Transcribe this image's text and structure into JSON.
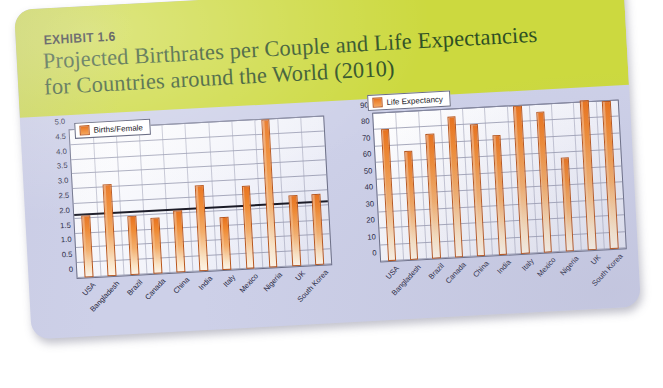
{
  "figure": {
    "exhibit_tag": "EXHIBIT 1.6",
    "title_line1": "Projected Birthrates per Couple and Life Expectancies",
    "title_line2": "for Countries around the World (2010)",
    "header_color": "#ccd93f",
    "title_color": "#2f5024",
    "panel_background": "#cdd0e8",
    "bar_color": "#e8731f"
  },
  "chart_data": [
    {
      "type": "bar",
      "title": "Projected Birthrates per Couple",
      "legend": [
        "Births/Female"
      ],
      "legend_position": "top-left-inside",
      "grid": true,
      "xlabel": "",
      "ylabel": "",
      "ylim": [
        0,
        5.0
      ],
      "yticks": [
        "0",
        "0.5",
        "1.0",
        "1.5",
        "2.0",
        "2.5",
        "3.0",
        "3.5",
        "4.0",
        "4.5",
        "5.0"
      ],
      "ytick_values": [
        0,
        0.5,
        1.0,
        1.5,
        2.0,
        2.5,
        3.0,
        3.5,
        4.0,
        4.5,
        5.0
      ],
      "reference_line": 2.1,
      "categories": [
        "USA",
        "Bangladesh",
        "Brazil",
        "Canada",
        "China",
        "India",
        "Italy",
        "Mexico",
        "Nigeria",
        "UK",
        "South Korea"
      ],
      "values": [
        2.1,
        3.1,
        2.0,
        1.9,
        2.1,
        2.9,
        1.8,
        2.8,
        5.0,
        2.4,
        2.4
      ]
    },
    {
      "type": "bar",
      "title": "Life Expectancies",
      "legend": [
        "Life Expectancy"
      ],
      "legend_position": "top-left-inside",
      "grid": true,
      "xlabel": "",
      "ylabel": "",
      "ylim": [
        0,
        90
      ],
      "yticks": [
        "0",
        "10",
        "20",
        "30",
        "40",
        "50",
        "60",
        "70",
        "80",
        "90"
      ],
      "ytick_values": [
        0,
        10,
        20,
        30,
        40,
        50,
        60,
        70,
        80,
        90
      ],
      "categories": [
        "USA",
        "Bangladesh",
        "Brazil",
        "Canada",
        "China",
        "India",
        "Italy",
        "Mexico",
        "Nigeria",
        "UK",
        "South Korea"
      ],
      "values": [
        80,
        66,
        76,
        86,
        80,
        73,
        90,
        86,
        57,
        91,
        90
      ]
    }
  ]
}
